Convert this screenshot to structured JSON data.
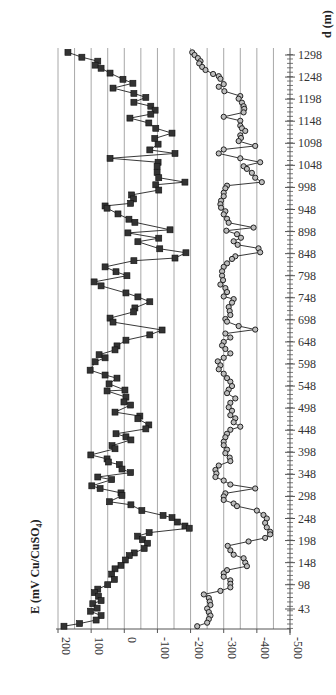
{
  "chart_data": {
    "type": "line",
    "orientation": "rotated-90deg (distance on vertical right axis, potential on horizontal bottom axis)",
    "title": "",
    "xlabel": "E (mV Cu/CuSO4)",
    "ylabel": "d (m)",
    "x_axis": {
      "label": "E (mV Cu/CuSO",
      "label_sub": "4",
      "label_end": ")",
      "ticks": [
        200,
        100,
        0,
        -100,
        -200,
        -300,
        -400,
        -500
      ],
      "tick_labels": [
        "200",
        "100",
        "0",
        "-100",
        "-200",
        "-300",
        "-400",
        "-500"
      ],
      "range": [
        200,
        -500
      ],
      "gridlines": [
        200,
        150,
        100,
        50,
        0,
        -50,
        -100,
        -150,
        -200,
        -250,
        -300,
        -350,
        -400,
        -450,
        -500
      ]
    },
    "y_axis": {
      "label": "d (m)",
      "ticks": [
        43,
        98,
        148,
        198,
        248,
        298,
        348,
        398,
        448,
        498,
        548,
        598,
        648,
        698,
        748,
        798,
        848,
        898,
        948,
        998,
        1048,
        1098,
        1148,
        1198,
        1248,
        1298
      ],
      "tick_labels": [
        "43",
        "98",
        "148",
        "198",
        "248",
        "298",
        "348",
        "398",
        "448",
        "498",
        "548",
        "598",
        "648",
        "698",
        "748",
        "798",
        "848",
        "898",
        "948",
        "998",
        "1048",
        "1098",
        "1148",
        "1198",
        "1248",
        "1298"
      ],
      "range": [
        0,
        1310
      ]
    },
    "grid": true,
    "legend": null,
    "series": [
      {
        "name": "Series 1 (squares)",
        "marker": "square",
        "points": [
          [
            1304,
            170
          ],
          [
            1293,
            128
          ],
          [
            1284,
            80
          ],
          [
            1275,
            88
          ],
          [
            1268,
            70
          ],
          [
            1257,
            43
          ],
          [
            1243,
            4
          ],
          [
            1234,
            -26
          ],
          [
            1223,
            34
          ],
          [
            1211,
            -29
          ],
          [
            1202,
            -65
          ],
          [
            1191,
            -29
          ],
          [
            1182,
            -80
          ],
          [
            1173,
            -93
          ],
          [
            1164,
            -80
          ],
          [
            1155,
            -17
          ],
          [
            1144,
            -74
          ],
          [
            1132,
            -95
          ],
          [
            1121,
            -144
          ],
          [
            1109,
            -92
          ],
          [
            1096,
            -102
          ],
          [
            1083,
            -77
          ],
          [
            1075,
            -153
          ],
          [
            1064,
            43
          ],
          [
            1055,
            -102
          ],
          [
            1046,
            -99
          ],
          [
            1032,
            -99
          ],
          [
            1020,
            -104
          ],
          [
            1010,
            -183
          ],
          [
            1004,
            -95
          ],
          [
            992,
            -104
          ],
          [
            981,
            -22
          ],
          [
            972,
            -28
          ],
          [
            962,
            -19
          ],
          [
            956,
            58
          ],
          [
            951,
            52
          ],
          [
            938,
            19
          ],
          [
            926,
            -14
          ],
          [
            919,
            -32
          ],
          [
            902,
            -138
          ],
          [
            895,
            -11
          ],
          [
            883,
            -104
          ],
          [
            875,
            -41
          ],
          [
            859,
            -107
          ],
          [
            850,
            -186
          ],
          [
            838,
            -153
          ],
          [
            832,
            -29
          ],
          [
            818,
            58
          ],
          [
            807,
            25
          ],
          [
            798,
            -8
          ],
          [
            784,
            91
          ],
          [
            775,
            70
          ],
          [
            759,
            -5
          ],
          [
            750,
            -41
          ],
          [
            739,
            -77
          ],
          [
            725,
            -32
          ],
          [
            716,
            -28
          ],
          [
            702,
            43
          ],
          [
            693,
            34
          ],
          [
            675,
            -114
          ],
          [
            664,
            -77
          ],
          [
            652,
            -5
          ],
          [
            639,
            22
          ],
          [
            630,
            28
          ],
          [
            619,
            76
          ],
          [
            612,
            58
          ],
          [
            603,
            88
          ],
          [
            584,
            103
          ],
          [
            573,
            58
          ],
          [
            566,
            22
          ],
          [
            553,
            46
          ],
          [
            539,
            -2
          ],
          [
            537,
            52
          ],
          [
            523,
            -5
          ],
          [
            512,
            1
          ],
          [
            505,
            -19
          ],
          [
            489,
            28
          ],
          [
            480,
            -47
          ],
          [
            474,
            -41
          ],
          [
            460,
            -74
          ],
          [
            451,
            -65
          ],
          [
            440,
            25
          ],
          [
            433,
            -5
          ],
          [
            426,
            -20
          ],
          [
            413,
            37
          ],
          [
            406,
            28
          ],
          [
            392,
            101
          ],
          [
            383,
            52
          ],
          [
            376,
            48
          ],
          [
            370,
            15
          ],
          [
            360,
            7
          ],
          [
            352,
            -19
          ],
          [
            342,
            80
          ],
          [
            336,
            38
          ],
          [
            322,
            98
          ],
          [
            316,
            73
          ],
          [
            306,
            10
          ],
          [
            300,
            7
          ],
          [
            286,
            45
          ],
          [
            279,
            -20
          ],
          [
            266,
            -53
          ],
          [
            255,
            -117
          ],
          [
            250,
            -144
          ],
          [
            240,
            -160
          ],
          [
            231,
            -183
          ],
          [
            226,
            -196
          ],
          [
            216,
            -75
          ],
          [
            208,
            -40
          ],
          [
            200,
            -55
          ],
          [
            192,
            -70
          ],
          [
            180,
            -60
          ],
          [
            170,
            -30
          ],
          [
            164,
            -15
          ],
          [
            154,
            -3
          ],
          [
            142,
            10
          ],
          [
            134,
            28
          ],
          [
            122,
            38
          ],
          [
            110,
            30
          ],
          [
            98,
            50
          ],
          [
            88,
            80
          ],
          [
            80,
            90
          ],
          [
            72,
            78
          ],
          [
            62,
            70
          ],
          [
            55,
            95
          ],
          [
            45,
            82
          ],
          [
            38,
            102
          ],
          [
            28,
            70
          ],
          [
            18,
            85
          ],
          [
            10,
            135
          ],
          [
            4,
            182
          ]
        ]
      },
      {
        "name": "Series 2 (circles)",
        "marker": "circle",
        "points": [
          [
            1304,
            -205
          ],
          [
            1298,
            -212
          ],
          [
            1291,
            -222
          ],
          [
            1284,
            -230
          ],
          [
            1279,
            -226
          ],
          [
            1271,
            -235
          ],
          [
            1264,
            -245
          ],
          [
            1255,
            -268
          ],
          [
            1250,
            -285
          ],
          [
            1244,
            -290
          ],
          [
            1232,
            -300
          ],
          [
            1226,
            -285
          ],
          [
            1216,
            -302
          ],
          [
            1205,
            -350
          ],
          [
            1199,
            -345
          ],
          [
            1190,
            -355
          ],
          [
            1182,
            -360
          ],
          [
            1176,
            -362
          ],
          [
            1168,
            -360
          ],
          [
            1158,
            -300
          ],
          [
            1149,
            -350
          ],
          [
            1138,
            -350
          ],
          [
            1132,
            -355
          ],
          [
            1126,
            -365
          ],
          [
            1116,
            -350
          ],
          [
            1110,
            -352
          ],
          [
            1103,
            -345
          ],
          [
            1092,
            -395
          ],
          [
            1084,
            -300
          ],
          [
            1075,
            -285
          ],
          [
            1064,
            -350
          ],
          [
            1055,
            -410
          ],
          [
            1046,
            -360
          ],
          [
            1040,
            -370
          ],
          [
            1031,
            -385
          ],
          [
            1020,
            -395
          ],
          [
            1010,
            -415
          ],
          [
            1002,
            -310
          ],
          [
            996,
            -305
          ],
          [
            986,
            -300
          ],
          [
            978,
            -300
          ],
          [
            968,
            -292
          ],
          [
            960,
            -290
          ],
          [
            952,
            -292
          ],
          [
            944,
            -305
          ],
          [
            937,
            -300
          ],
          [
            927,
            -310
          ],
          [
            918,
            -315
          ],
          [
            907,
            -390
          ],
          [
            900,
            -308
          ],
          [
            892,
            -340
          ],
          [
            884,
            -352
          ],
          [
            876,
            -330
          ],
          [
            868,
            -342
          ],
          [
            860,
            -405
          ],
          [
            851,
            -410
          ],
          [
            842,
            -335
          ],
          [
            836,
            -325
          ],
          [
            826,
            -310
          ],
          [
            818,
            -300
          ],
          [
            808,
            -295
          ],
          [
            798,
            -295
          ],
          [
            788,
            -298
          ],
          [
            778,
            -290
          ],
          [
            770,
            -305
          ],
          [
            761,
            -310
          ],
          [
            751,
            -300
          ],
          [
            745,
            -330
          ],
          [
            737,
            -325
          ],
          [
            727,
            -315
          ],
          [
            718,
            -318
          ],
          [
            709,
            -320
          ],
          [
            700,
            -305
          ],
          [
            694,
            -310
          ],
          [
            684,
            -345
          ],
          [
            676,
            -395
          ],
          [
            667,
            -305
          ],
          [
            658,
            -320
          ],
          [
            648,
            -300
          ],
          [
            640,
            -295
          ],
          [
            632,
            -305
          ],
          [
            622,
            -320
          ],
          [
            612,
            -300
          ],
          [
            604,
            -282
          ],
          [
            595,
            -290
          ],
          [
            586,
            -285
          ],
          [
            576,
            -300
          ],
          [
            566,
            -310
          ],
          [
            558,
            -320
          ],
          [
            548,
            -325
          ],
          [
            540,
            -315
          ],
          [
            532,
            -310
          ],
          [
            520,
            -335
          ],
          [
            510,
            -320
          ],
          [
            500,
            -315
          ],
          [
            492,
            -325
          ],
          [
            482,
            -320
          ],
          [
            475,
            -335
          ],
          [
            466,
            -330
          ],
          [
            456,
            -350
          ],
          [
            449,
            -320
          ],
          [
            440,
            -310
          ],
          [
            432,
            -305
          ],
          [
            422,
            -300
          ],
          [
            414,
            -300
          ],
          [
            404,
            -310
          ],
          [
            396,
            -305
          ],
          [
            386,
            -318
          ],
          [
            378,
            -320
          ],
          [
            368,
            -285
          ],
          [
            358,
            -275
          ],
          [
            350,
            -278
          ],
          [
            342,
            -275
          ],
          [
            334,
            -300
          ],
          [
            325,
            -320
          ],
          [
            316,
            -395
          ],
          [
            305,
            -305
          ],
          [
            298,
            -300
          ],
          [
            290,
            -300
          ],
          [
            282,
            -330
          ],
          [
            276,
            -340
          ],
          [
            266,
            -400
          ],
          [
            256,
            -420
          ],
          [
            248,
            -430
          ],
          [
            238,
            -425
          ],
          [
            228,
            -430
          ],
          [
            218,
            -440
          ],
          [
            212,
            -440
          ],
          [
            204,
            -425
          ],
          [
            196,
            -375
          ],
          [
            186,
            -312
          ],
          [
            176,
            -320
          ],
          [
            166,
            -330
          ],
          [
            158,
            -360
          ],
          [
            148,
            -365
          ],
          [
            140,
            -370
          ],
          [
            131,
            -310
          ],
          [
            124,
            -300
          ],
          [
            116,
            -300
          ],
          [
            108,
            -320
          ],
          [
            100,
            -320
          ],
          [
            92,
            -320
          ],
          [
            84,
            -290
          ],
          [
            76,
            -240
          ],
          [
            68,
            -255
          ],
          [
            60,
            -258
          ],
          [
            52,
            -260
          ],
          [
            44,
            -250
          ],
          [
            36,
            -255
          ],
          [
            28,
            -260
          ],
          [
            20,
            -255
          ],
          [
            12,
            -250
          ],
          [
            4,
            -220
          ]
        ]
      }
    ]
  },
  "layout": {
    "plot_left_px": 58,
    "plot_right_px": 290,
    "plot_top_px": 48,
    "plot_bottom_px": 629,
    "d_top_value": 1298,
    "d_top_px": 55,
    "d_bottom_value": 43,
    "d_bottom_px": 609,
    "colors": {
      "grid": "#a8a8a8",
      "axis": "#555555",
      "series": "#222222",
      "marker_fill_square": "#333333",
      "marker_fill_circle": "#bdbdbd"
    }
  }
}
